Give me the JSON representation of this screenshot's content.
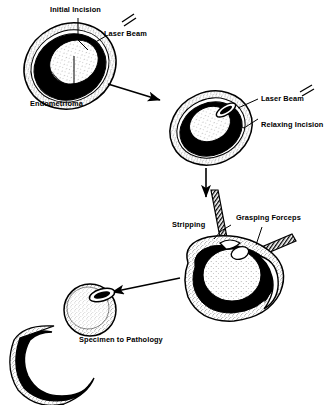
{
  "figure": {
    "style": "black-and-white stipple line drawing",
    "background_color": "#ffffff",
    "ink_color": "#000000"
  },
  "panels": [
    {
      "id": "panel-1",
      "name": "initial-incision-panel",
      "description": "Ovary containing endometrioma with initial incision made by laser",
      "labels": [
        "Initial Incision",
        "Laser Beam",
        "Endometrioma"
      ]
    },
    {
      "id": "panel-2",
      "name": "relaxing-incision-panel",
      "description": "Ovary with relaxing incision created by laser beam",
      "labels": [
        "Laser Beam",
        "Relaxing Incision"
      ]
    },
    {
      "id": "panel-3",
      "name": "stripping-panel",
      "description": "Cyst wall stripped from ovary using two grasping forceps",
      "labels": [
        "Stripping",
        "Grasping Forceps"
      ]
    },
    {
      "id": "panel-4",
      "name": "specimen-panel",
      "description": "Remaining ovary and excised crescent shaped cyst wall specimen",
      "labels": [
        "Specimen to Pathology"
      ]
    }
  ],
  "labels": {
    "initial_incision": "Initial Incision",
    "laser_beam_1": "Laser Beam",
    "endometrioma": "Endometrioma",
    "laser_beam_2": "Laser Beam",
    "relaxing_incision": "Relaxing Incision",
    "stripping": "Stripping",
    "grasping_forceps": "Grasping Forceps",
    "specimen_to_pathology": "Specimen to Pathology"
  },
  "arrows": [
    {
      "name": "arrow-panel1-to-panel2",
      "direction": "down-right"
    },
    {
      "name": "arrow-panel2-to-panel3",
      "direction": "down"
    },
    {
      "name": "arrow-panel3-to-panel4",
      "direction": "left"
    }
  ],
  "icons": {
    "laser_beam_symbol": "laser-beam-double-line-icon",
    "forceps_shaft": "hatched-instrument-shaft-icon"
  }
}
